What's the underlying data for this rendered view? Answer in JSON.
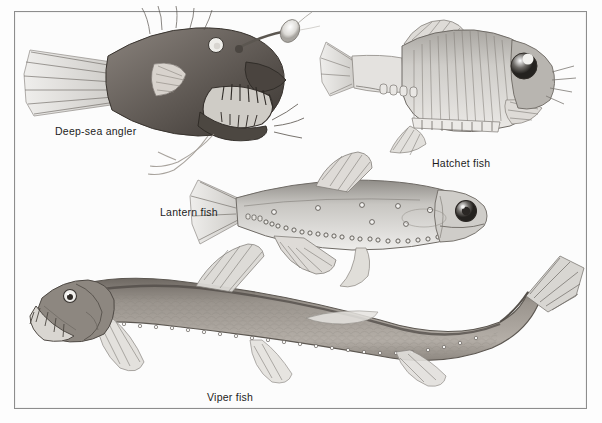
{
  "plate": {
    "background_color": "#fcfcfc",
    "border_color": "#8d8d8d",
    "medium": "graphite pencil scientific illustration",
    "width": 602,
    "height": 423
  },
  "specimens": [
    {
      "id": "deep-sea-angler",
      "label": "Deep-sea angler",
      "label_x": 55,
      "label_y": 125,
      "facing": "right",
      "body_color": "#6a6460",
      "features": [
        "illicium",
        "esca lure",
        "fang teeth",
        "gaping jaw",
        "fan caudal fin",
        "trailing pelvic filaments"
      ]
    },
    {
      "id": "hatchet-fish",
      "label": "Hatchet fish",
      "label_x": 432,
      "label_y": 157,
      "facing": "right",
      "body_color": "#b9b6b1",
      "features": [
        "deep compressed body",
        "telescopic eye",
        "ventral photophore row",
        "dorsal fin",
        "forked tail"
      ]
    },
    {
      "id": "lantern-fish",
      "label": "Lantern fish",
      "label_x": 160,
      "label_y": 206,
      "facing": "right",
      "body_color": "#c3c1bc",
      "features": [
        "large round eye",
        "photophore dots along belly",
        "adipose fin",
        "forked caudal fin"
      ]
    },
    {
      "id": "viper-fish",
      "label": "Viper fish",
      "label_x": 207,
      "label_y": 391,
      "facing": "left",
      "body_color": "#9a948d",
      "features": [
        "elongate body",
        "hexagonal scale pattern",
        "fanged jaw",
        "ventral photophore line",
        "upturned tail"
      ]
    }
  ]
}
